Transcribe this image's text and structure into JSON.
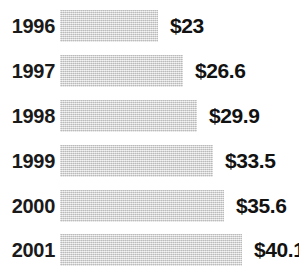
{
  "chart_data": {
    "type": "bar",
    "orientation": "horizontal",
    "title": "",
    "subtitle": "",
    "xlabel": "",
    "ylabel": "",
    "grid": false,
    "legend": false,
    "axis_visible": false,
    "value_prefix": "$",
    "categories": [
      "1996",
      "1997",
      "1998",
      "1999",
      "2000",
      "2001"
    ],
    "values": [
      23,
      26.6,
      29.9,
      33.5,
      35.6,
      40.1
    ],
    "value_labels": [
      "$23",
      "$26.6",
      "$29.9",
      "$33.5",
      "$35.6",
      "$40.1"
    ],
    "xlim": [
      0,
      40.1
    ],
    "colors": {
      "bar_fill": "#d2d2d2",
      "text": "#121212",
      "background": "#ffffff"
    },
    "bars": [
      {
        "category": "1996",
        "value": 23,
        "label": "$23",
        "bar_width_px": 98,
        "top_px": 10
      },
      {
        "category": "1997",
        "value": 26.6,
        "label": "$26.6",
        "bar_width_px": 123,
        "top_px": 55
      },
      {
        "category": "1998",
        "value": 29.9,
        "label": "$29.9",
        "bar_width_px": 137,
        "top_px": 100
      },
      {
        "category": "1999",
        "value": 33.5,
        "label": "$33.5",
        "bar_width_px": 153,
        "top_px": 145
      },
      {
        "category": "2000",
        "value": 35.6,
        "label": "$35.6",
        "bar_width_px": 164,
        "top_px": 190
      },
      {
        "category": "2001",
        "value": 40.1,
        "label": "$40.1",
        "bar_width_px": 182,
        "top_px": 234
      }
    ]
  }
}
